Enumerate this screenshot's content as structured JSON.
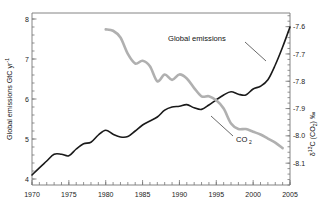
{
  "chart_data": {
    "type": "line",
    "title": "",
    "xlabel": "",
    "ylabel": "Global emissions GtC yr",
    "ylabel_exponent": "-1",
    "ylabel_unit": "GtC yr",
    "y2label_delta": "δ",
    "y2label_sup": "13",
    "y2label_rest": "C (CO",
    "y2label_sub": "2",
    "y2label_tail": ") ‰",
    "xlim": [
      1970,
      2005
    ],
    "ylim": [
      3.85,
      8.15
    ],
    "y2lim": [
      -8.18,
      -7.55
    ],
    "grid": false,
    "legend": "inline-annotations",
    "xticks": [
      1970,
      1975,
      1980,
      1985,
      1990,
      1995,
      2000,
      2005
    ],
    "xtick_labels": [
      "1970",
      "1975",
      "1980",
      "1985",
      "1990",
      "1995",
      "2000",
      "2005"
    ],
    "xminor_step": 1,
    "yticks": [
      4,
      5,
      6,
      7,
      8
    ],
    "ytick_labels": [
      "4",
      "5",
      "6",
      "7",
      "8"
    ],
    "yminor_step": 0.2,
    "y2ticks": [
      -8.1,
      -8.0,
      -7.9,
      -7.8,
      -7.7,
      -7.6
    ],
    "y2tick_labels": [
      "-8.1",
      "-8.0",
      "-7.9",
      "-7.8",
      "-7.7",
      "-7.6"
    ],
    "y2minor_step": 0.02,
    "series": [
      {
        "name": "Global emissions",
        "axis": "left",
        "color": "#1a1a1a",
        "width": 1.6,
        "label_text": "Global emissions",
        "x": [
          1970,
          1971,
          1972,
          1973,
          1974,
          1975,
          1976,
          1977,
          1978,
          1979,
          1980,
          1981,
          1982,
          1983,
          1984,
          1985,
          1986,
          1987,
          1988,
          1989,
          1990,
          1991,
          1992,
          1993,
          1994,
          1995,
          1996,
          1997,
          1998,
          1999,
          2000,
          2001,
          2002,
          2003,
          2004,
          2005
        ],
        "values": [
          4.1,
          4.28,
          4.45,
          4.62,
          4.62,
          4.58,
          4.75,
          4.88,
          4.92,
          5.1,
          5.22,
          5.12,
          5.05,
          5.06,
          5.2,
          5.35,
          5.45,
          5.55,
          5.72,
          5.8,
          5.82,
          5.86,
          5.78,
          5.74,
          5.85,
          5.98,
          6.1,
          6.18,
          6.12,
          6.1,
          6.25,
          6.32,
          6.48,
          6.85,
          7.3,
          7.8
        ]
      },
      {
        "name": "CO2",
        "axis": "right",
        "color": "#b0b0b0",
        "width": 2.6,
        "label_text": "CO",
        "label_sub": "2",
        "x": [
          1980,
          1981,
          1982,
          1983,
          1984,
          1985,
          1986,
          1987,
          1988,
          1989,
          1990,
          1991,
          1992,
          1993,
          1994,
          1995,
          1996,
          1997,
          1998,
          1999,
          2000,
          2001,
          2002,
          2003,
          2004
        ],
        "values": [
          -7.61,
          -7.615,
          -7.64,
          -7.7,
          -7.735,
          -7.725,
          -7.745,
          -7.8,
          -7.775,
          -7.795,
          -7.775,
          -7.79,
          -7.825,
          -7.855,
          -7.855,
          -7.87,
          -7.9,
          -7.955,
          -7.975,
          -7.975,
          -7.985,
          -7.995,
          -8.01,
          -8.025,
          -8.045
        ]
      }
    ],
    "annotations": [
      {
        "name": "global-emissions-label",
        "text": "Global emissions"
      },
      {
        "name": "co2-label",
        "text": "CO2"
      }
    ]
  }
}
